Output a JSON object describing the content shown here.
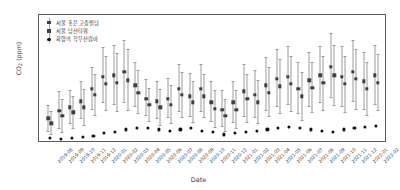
{
  "chart_data": {
    "type": "scatter",
    "title": "",
    "xlabel": "Date",
    "ylabel": "CO2 (ppm)",
    "ylabel_main": "CO",
    "ylabel_sub": "2",
    "ylabel_unit": " (ppm)",
    "ylim": [
      408,
      512
    ],
    "yticks": [
      420,
      440,
      460,
      480,
      500
    ],
    "grid": false,
    "legend_position": "top-left",
    "errorbars": true,
    "categories": [
      "2019-08",
      "2019-09",
      "2019-10",
      "2019-11",
      "2019-12",
      "2020-01",
      "2020-02",
      "2020-03",
      "2020-04",
      "2020-05",
      "2020-06",
      "2020-07",
      "2020-08",
      "2020-09",
      "2020-10",
      "2020-11",
      "2020-12",
      "2021-01",
      "2021-02",
      "2021-03",
      "2021-04",
      "2021-05",
      "2021-06",
      "2021-07",
      "2021-08",
      "2021-09",
      "2021-10",
      "2021-11",
      "2021-12",
      "2022-01",
      "2022-02"
    ],
    "series": [
      {
        "name": "서울 홍은 고층빌딩",
        "color": "#3f3f3f",
        "marker": "square",
        "values": [
          428,
          434,
          437,
          442,
          452,
          462,
          463,
          466,
          455,
          444,
          442,
          444,
          452,
          446,
          452,
          441,
          435,
          441,
          450,
          447,
          455,
          460,
          462,
          452,
          459,
          463,
          470,
          462,
          466,
          458,
          463
        ],
        "err_low": [
          418,
          420,
          424,
          428,
          436,
          441,
          440,
          441,
          438,
          431,
          428,
          429,
          434,
          430,
          434,
          426,
          422,
          425,
          430,
          429,
          435,
          438,
          440,
          432,
          438,
          441,
          445,
          438,
          442,
          436,
          440
        ],
        "err_high": [
          439,
          450,
          451,
          458,
          470,
          486,
          488,
          492,
          474,
          460,
          458,
          461,
          472,
          465,
          472,
          458,
          451,
          458,
          472,
          467,
          478,
          484,
          487,
          474,
          482,
          487,
          497,
          487,
          492,
          482,
          488
        ]
      },
      {
        "name": "서울 남산타워",
        "color": "#3f3f3f",
        "marker": "square",
        "values": [
          424,
          430,
          433,
          437,
          447,
          456,
          457,
          459,
          449,
          439,
          437,
          439,
          447,
          441,
          446,
          436,
          430,
          435,
          444,
          441,
          449,
          454,
          456,
          446,
          453,
          457,
          463,
          456,
          460,
          452,
          457
        ],
        "err_low": [
          415,
          417,
          420,
          423,
          431,
          435,
          434,
          435,
          432,
          426,
          423,
          424,
          429,
          425,
          429,
          421,
          418,
          420,
          425,
          424,
          430,
          432,
          434,
          427,
          433,
          435,
          439,
          433,
          436,
          431,
          435
        ],
        "err_high": [
          434,
          444,
          446,
          452,
          464,
          479,
          481,
          484,
          467,
          453,
          452,
          455,
          466,
          458,
          464,
          451,
          444,
          451,
          464,
          459,
          470,
          476,
          479,
          466,
          474,
          479,
          488,
          479,
          484,
          474,
          480
        ]
      },
      {
        "name": "화양의 학무산림아",
        "color": "#111111",
        "marker": "circle",
        "values": [
          412,
          411,
          412,
          413,
          414,
          416,
          417,
          419,
          420,
          420,
          419,
          418,
          419,
          420,
          418,
          417,
          415,
          416,
          417,
          418,
          419,
          420,
          421,
          420,
          419,
          418,
          417,
          419,
          420,
          421,
          422
        ],
        "err_low": [],
        "err_high": []
      }
    ]
  }
}
